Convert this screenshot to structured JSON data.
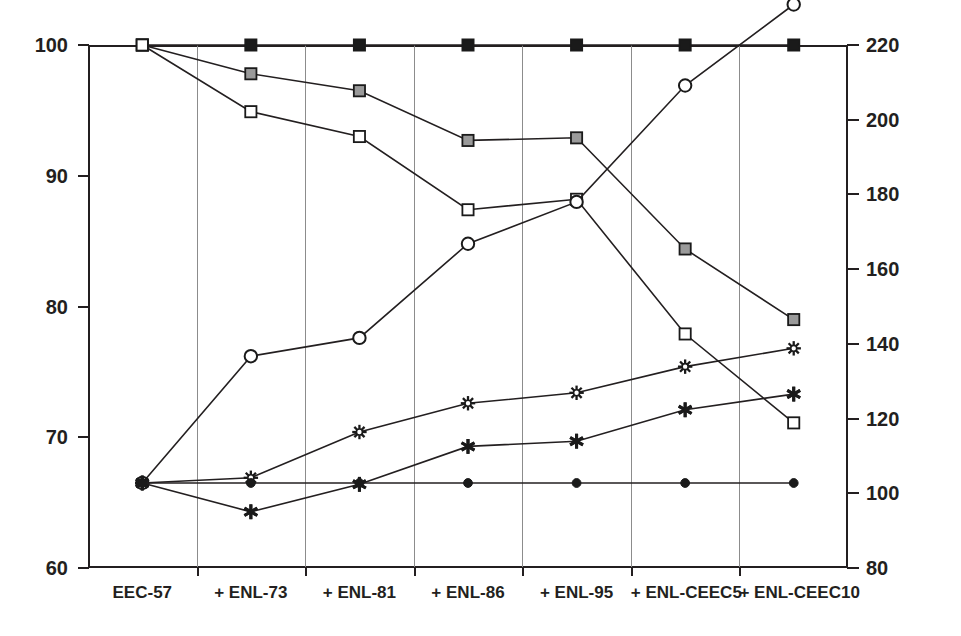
{
  "chart_data": {
    "type": "line",
    "title": "",
    "subtitle": "",
    "xlabel": "",
    "ylabel": "",
    "categories": [
      "EEC-57",
      "+ ENL-73",
      "+ ENL-81",
      "+ ENL-86",
      "+ ENL-95",
      "+ ENL-CEEC5",
      "+ ENL-CEEC10"
    ],
    "grid": true,
    "legend_position": "none",
    "axes": [
      {
        "id": "left",
        "position": "left",
        "ylim": [
          60,
          100
        ],
        "ticks": [
          60,
          70,
          80,
          90,
          100
        ],
        "ticklabels": [
          "60",
          "70",
          "80",
          "90",
          "100"
        ]
      },
      {
        "id": "right",
        "position": "right",
        "ylim": [
          80,
          220
        ],
        "ticks": [
          80,
          100,
          120,
          140,
          160,
          180,
          200,
          220
        ],
        "ticklabels": [
          "80",
          "100",
          "120",
          "140",
          "160",
          "180",
          "200",
          "220"
        ]
      }
    ],
    "series": [
      {
        "name": "filled-square-series",
        "axis": "left",
        "marker": "filled-square",
        "marker_fill": "#1a1a1a",
        "marker_stroke": "#1a1a1a",
        "values": [
          100.0,
          100.0,
          100.0,
          100.0,
          100.0,
          100.0,
          100.0
        ]
      },
      {
        "name": "gray-square-series",
        "axis": "left",
        "marker": "gray-square",
        "marker_fill": "#9a9a9a",
        "marker_stroke": "#1a1a1a",
        "values": [
          100.0,
          97.8,
          96.5,
          92.7,
          92.9,
          84.4,
          79.0
        ]
      },
      {
        "name": "open-square-series",
        "axis": "left",
        "marker": "open-square",
        "marker_fill": "#ffffff",
        "marker_stroke": "#1a1a1a",
        "values": [
          100.0,
          94.9,
          93.0,
          87.4,
          88.2,
          77.9,
          71.1
        ]
      },
      {
        "name": "open-circle-series",
        "axis": "left",
        "marker": "open-circle",
        "marker_fill": "#ffffff",
        "marker_stroke": "#1a1a1a",
        "values": [
          66.5,
          76.2,
          77.6,
          84.8,
          88.0,
          96.9,
          103.1
        ]
      },
      {
        "name": "starburst-series",
        "axis": "left",
        "marker": "starburst",
        "marker_fill": "#ffffff",
        "marker_stroke": "#1a1a1a",
        "values": [
          66.5,
          66.9,
          70.4,
          72.6,
          73.4,
          75.4,
          76.8
        ]
      },
      {
        "name": "bold-asterisk-series",
        "axis": "left",
        "marker": "bold-asterisk",
        "marker_fill": "#1a1a1a",
        "marker_stroke": "#1a1a1a",
        "values": [
          66.5,
          64.3,
          66.4,
          69.3,
          69.7,
          72.1,
          73.3
        ]
      },
      {
        "name": "filled-circle-series",
        "axis": "left",
        "marker": "filled-circle",
        "marker_fill": "#1a1a1a",
        "marker_stroke": "#1a1a1a",
        "values": [
          66.5,
          66.5,
          66.5,
          66.5,
          66.5,
          66.5,
          66.5
        ]
      }
    ]
  },
  "colors": {
    "axis": "#231f20",
    "grid": "#8c8c8c",
    "marker_dark": "#1a1a1a",
    "marker_gray": "#9a9a9a",
    "marker_open": "#ffffff",
    "background": "#ffffff"
  }
}
